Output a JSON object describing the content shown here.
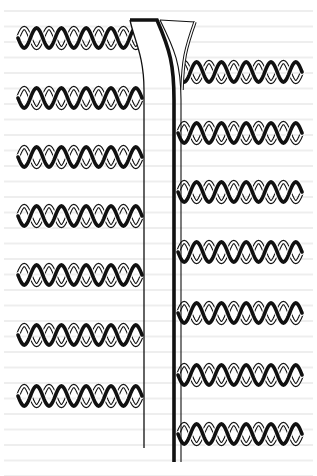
{
  "figure": {
    "colors": {
      "background": "#ffffff",
      "ink": "#111111",
      "paper_bleed": "#cfcfcf"
    },
    "fork": {
      "top_y": 20,
      "left_x": 130,
      "right_x": 195,
      "left_strand_x": 144,
      "thick_strand_x": 174,
      "thin_strand_x": 181,
      "bottom_left_y": 448,
      "bottom_right_y": 462
    },
    "left_helices": [
      {
        "y": 38,
        "x_start": 18,
        "x_end": 142,
        "style": "wavy-start"
      },
      {
        "y": 98,
        "x_start": 18,
        "x_end": 142
      },
      {
        "y": 157,
        "x_start": 18,
        "x_end": 142
      },
      {
        "y": 216,
        "x_start": 18,
        "x_end": 142
      },
      {
        "y": 275,
        "x_start": 18,
        "x_end": 142
      },
      {
        "y": 335,
        "x_start": 18,
        "x_end": 142
      },
      {
        "y": 396,
        "x_start": 18,
        "x_end": 142
      }
    ],
    "right_helices": [
      {
        "y": 72,
        "x_start": 178,
        "x_end": 302,
        "style": "round-end"
      },
      {
        "y": 133,
        "x_start": 178,
        "x_end": 302
      },
      {
        "y": 192,
        "x_start": 178,
        "x_end": 302
      },
      {
        "y": 252,
        "x_start": 178,
        "x_end": 302
      },
      {
        "y": 313,
        "x_start": 178,
        "x_end": 302
      },
      {
        "y": 375,
        "x_start": 178,
        "x_end": 302
      },
      {
        "y": 434,
        "x_start": 178,
        "x_end": 302
      }
    ],
    "turns_per_helix": 5
  }
}
